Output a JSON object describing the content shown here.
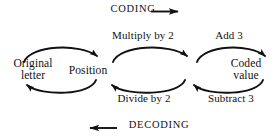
{
  "diagram": {
    "type": "flow-diagram",
    "background_color": "#ffffff",
    "stroke_color": "#111111",
    "text_color": "#111111",
    "nodes": [
      {
        "id": "original-letter",
        "lines": [
          "Original",
          "letter"
        ]
      },
      {
        "id": "position",
        "lines": [
          "Position"
        ]
      },
      {
        "id": "coded-value",
        "lines": [
          "Coded",
          "value"
        ]
      }
    ],
    "forward_edges": [
      {
        "id": "original-to-position",
        "label": ""
      },
      {
        "id": "position-to-intermediate",
        "label": "Multiply by 2"
      },
      {
        "id": "intermediate-to-coded",
        "label": "Add 3"
      }
    ],
    "reverse_edges": [
      {
        "id": "coded-to-intermediate",
        "label": "Subtract 3"
      },
      {
        "id": "intermediate-to-position",
        "label": "Divide by 2"
      },
      {
        "id": "position-to-original",
        "label": ""
      }
    ],
    "flow_indicators": [
      {
        "id": "coding",
        "label": "CODING",
        "direction": "right",
        "position": "top"
      },
      {
        "id": "decoding",
        "label": "DECODING",
        "direction": "left",
        "position": "bottom"
      }
    ]
  }
}
